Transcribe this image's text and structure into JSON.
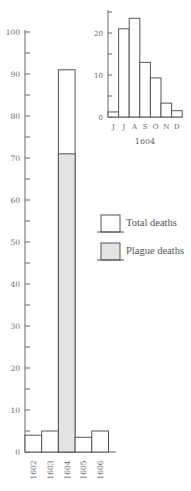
{
  "chart_data": [
    {
      "type": "bar",
      "title": "",
      "xlabel": "",
      "ylabel": "",
      "categories": [
        "1602",
        "1603",
        "1604",
        "1605",
        "1606"
      ],
      "series": [
        {
          "name": "Total deaths",
          "values": [
            4,
            5,
            91,
            3.5,
            5
          ]
        },
        {
          "name": "Plague deaths",
          "values": [
            0,
            0,
            71,
            0,
            0
          ]
        }
      ],
      "ylim": [
        0,
        100
      ],
      "yticks": [
        0,
        10,
        20,
        30,
        40,
        50,
        60,
        70,
        80,
        90,
        100
      ],
      "grid": false,
      "legend_position": "right-middle"
    },
    {
      "type": "bar",
      "title": "",
      "xlabel": "1604",
      "ylabel": "",
      "categories": [
        "J",
        "J",
        "A",
        "S",
        "O",
        "N",
        "D"
      ],
      "values": [
        1.2,
        21,
        23.5,
        13,
        9.3,
        3.3,
        1.5
      ],
      "ylim": [
        0,
        25
      ],
      "yticks": [
        0,
        10,
        20
      ],
      "grid": false
    }
  ],
  "legend": {
    "total": "Total deaths",
    "plague": "Plague deaths"
  },
  "main": {
    "ytick_labels": [
      "0",
      "10",
      "20",
      "30",
      "40",
      "50",
      "60",
      "70",
      "80",
      "90",
      "100"
    ],
    "year_labels": [
      "1602",
      "1603",
      "1604",
      "1605",
      "1606"
    ]
  },
  "inset": {
    "ytick_labels": [
      "0",
      "10",
      "20"
    ],
    "month_labels": [
      "J",
      "J",
      "A",
      "S",
      "O",
      "N",
      "D"
    ],
    "caption": "1604"
  },
  "colors": {
    "axis": "#666666",
    "bar_outline": "#555555",
    "plague_fill": "#e3e3e3",
    "total_fill": "#ffffff"
  }
}
